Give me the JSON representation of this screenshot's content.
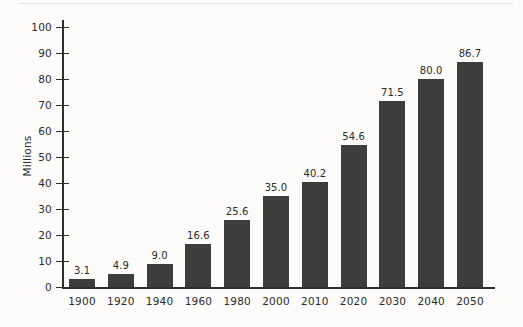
{
  "chart_data": {
    "type": "bar",
    "title": "",
    "subtitle": "",
    "xlabel": "",
    "ylabel": "Millions",
    "ylim": [
      0,
      100
    ],
    "y_ticks": [
      0,
      10,
      20,
      30,
      40,
      50,
      60,
      70,
      80,
      90,
      100
    ],
    "y_tick_labels": [
      "0",
      "10",
      "20",
      "30",
      "40",
      "50",
      "60",
      "70",
      "80",
      "90",
      "100"
    ],
    "grid": false,
    "legend": false,
    "orientation": "vertical",
    "categories": [
      "1900",
      "1920",
      "1940",
      "1960",
      "1980",
      "2000",
      "2010",
      "2020",
      "2030",
      "2040",
      "2050"
    ],
    "values": [
      3.1,
      4.9,
      9.0,
      16.6,
      25.6,
      35.0,
      40.2,
      54.6,
      71.5,
      80.0,
      86.7
    ],
    "value_labels": [
      "3.1",
      "4.9",
      "9.0",
      "16.6",
      "25.6",
      "35.0",
      "40.2",
      "54.6",
      "71.5",
      "80.0",
      "86.7"
    ],
    "bar_color": "#3d3d3d",
    "axis_color": "#2f2f2f",
    "background_color": "#fdfcfa",
    "text_color": "#2b2b2b"
  }
}
